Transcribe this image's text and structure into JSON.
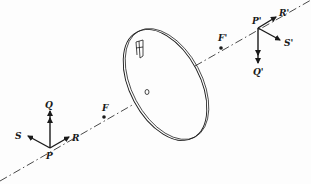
{
  "diagram": {
    "colors": {
      "ink": "#1a1a1a",
      "background": "#fdfdfd"
    },
    "object_point": {
      "label": "P",
      "axes": {
        "up": "Q",
        "left": "S",
        "right": "R"
      }
    },
    "object_focus": {
      "label": "F"
    },
    "image_focus": {
      "label": "F'"
    },
    "image_point": {
      "label": "P'",
      "axes": {
        "down": "Q'",
        "right": "S'",
        "up_right": "R'"
      }
    },
    "lens": {
      "glyph": "aperture-mark"
    }
  }
}
